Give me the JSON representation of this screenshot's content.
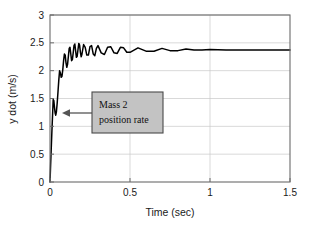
{
  "chart_data": {
    "type": "line",
    "title": "",
    "xlabel": "Time (sec)",
    "ylabel": "y dot (m/s)",
    "xlim": [
      0,
      1.5
    ],
    "ylim": [
      0,
      3
    ],
    "xticks": [
      "0",
      "0.5",
      "1",
      "1.5"
    ],
    "xtick_values": [
      0,
      0.5,
      1,
      1.5
    ],
    "yticks": [
      "0",
      "0.5",
      "1",
      "1.5",
      "2",
      "2.5",
      "3"
    ],
    "ytick_values": [
      0,
      0.5,
      1,
      1.5,
      2,
      2.5,
      3
    ],
    "grid": true,
    "legend": "none",
    "series": [
      {
        "name": "Mass 2 position rate",
        "color": "#000000",
        "steady_state": 2.37,
        "description": "Step response: rapid rise from 0 to about 1.5 at t=0.02 s, dip to 1.2, then underdamped oscillation growing to a peak near 2.5 around t=0.17 s, decaying oscillations settling to 2.37 m/s by t=1.0 s",
        "x": [
          0,
          0.004,
          0.008,
          0.012,
          0.016,
          0.02,
          0.024,
          0.028,
          0.032,
          0.036,
          0.04,
          0.045,
          0.05,
          0.055,
          0.06,
          0.065,
          0.07,
          0.075,
          0.08,
          0.085,
          0.09,
          0.095,
          0.1,
          0.105,
          0.11,
          0.115,
          0.12,
          0.125,
          0.13,
          0.135,
          0.14,
          0.145,
          0.15,
          0.155,
          0.16,
          0.165,
          0.17,
          0.175,
          0.18,
          0.185,
          0.19,
          0.195,
          0.2,
          0.21,
          0.22,
          0.23,
          0.24,
          0.25,
          0.26,
          0.27,
          0.28,
          0.29,
          0.3,
          0.32,
          0.34,
          0.36,
          0.38,
          0.4,
          0.42,
          0.44,
          0.46,
          0.48,
          0.5,
          0.55,
          0.6,
          0.65,
          0.7,
          0.75,
          0.8,
          0.85,
          0.9,
          0.95,
          1.0,
          1.1,
          1.2,
          1.3,
          1.4,
          1.5
        ],
        "y": [
          0.0,
          0.32,
          0.62,
          0.92,
          1.2,
          1.48,
          1.46,
          1.34,
          1.24,
          1.2,
          1.26,
          1.42,
          1.62,
          1.83,
          2.0,
          1.96,
          1.88,
          1.9,
          2.02,
          2.18,
          2.3,
          2.28,
          2.14,
          2.06,
          2.12,
          2.26,
          2.4,
          2.42,
          2.3,
          2.18,
          2.2,
          2.32,
          2.45,
          2.48,
          2.36,
          2.24,
          2.26,
          2.38,
          2.49,
          2.46,
          2.33,
          2.25,
          2.3,
          2.47,
          2.42,
          2.28,
          2.28,
          2.43,
          2.45,
          2.3,
          2.27,
          2.4,
          2.45,
          2.32,
          2.29,
          2.42,
          2.43,
          2.32,
          2.31,
          2.42,
          2.41,
          2.33,
          2.33,
          2.41,
          2.35,
          2.35,
          2.4,
          2.36,
          2.36,
          2.39,
          2.37,
          2.37,
          2.38,
          2.37,
          2.37,
          2.37,
          2.37,
          2.37
        ]
      }
    ],
    "annotations": [
      {
        "text_line1": "Mass 2",
        "text_line2": "position rate",
        "box_facecolor": "#c3c3c3",
        "box_edgecolor": "#4a4a4a",
        "arrow_points_to_x": 0.075,
        "arrow_points_to_y": 1.3
      }
    ]
  }
}
